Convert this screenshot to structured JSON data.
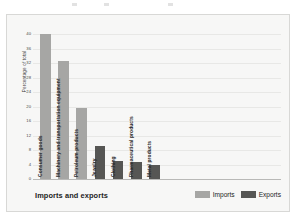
{
  "chart_data": {
    "type": "bar",
    "title": "",
    "xlabel": "Imports and exports",
    "ylabel": "Percentage of total",
    "ylim": [
      0,
      40
    ],
    "grid": true,
    "legend_position": "bottom-right",
    "yticks": [
      0,
      4,
      8,
      12,
      16,
      20,
      24,
      28,
      32,
      36,
      40
    ],
    "categories": [
      "Consumer goods",
      "Machinery and transportation equipment",
      "Petroleum products",
      "Jewelry",
      "Clothing",
      "Pharmaceutical products",
      "Metal products"
    ],
    "series": [
      {
        "name": "Imports",
        "color": "#a6a6a4",
        "values": [
          40,
          32.5,
          19.5,
          null,
          null,
          null,
          null
        ]
      },
      {
        "name": "Exports",
        "color": "#565654",
        "values": [
          null,
          null,
          null,
          9.2,
          5.0,
          4.6,
          3.8
        ]
      }
    ],
    "bars": [
      {
        "label": "Consumer goods",
        "value": 40,
        "series": "Imports"
      },
      {
        "label": "Machinery and transportation equipment",
        "value": 32.5,
        "series": "Imports"
      },
      {
        "label": "Petroleum products",
        "value": 19.5,
        "series": "Imports"
      },
      {
        "label": "Jewelry",
        "value": 9.2,
        "series": "Exports"
      },
      {
        "label": "Clothing",
        "value": 5.0,
        "series": "Exports"
      },
      {
        "label": "Pharmaceutical products",
        "value": 4.6,
        "series": "Exports"
      },
      {
        "label": "Metal products",
        "value": 3.8,
        "series": "Exports"
      }
    ]
  },
  "legend": {
    "items": [
      {
        "label": "Imports",
        "color": "#a6a6a4"
      },
      {
        "label": "Exports",
        "color": "#565654"
      }
    ]
  },
  "colors": {
    "imports": "#a6a6a4",
    "exports": "#565654",
    "panel_background": "#f7f7f6",
    "gridline": "#e8e8e6"
  }
}
